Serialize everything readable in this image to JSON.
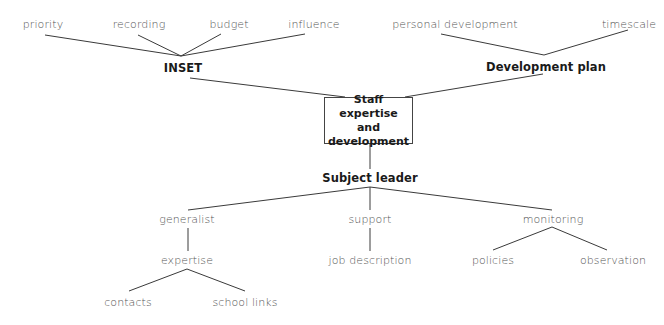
{
  "diagram": {
    "type": "concept-map",
    "center": {
      "label_lines": [
        "Staff expertise",
        "and",
        "development"
      ]
    },
    "top_left": {
      "label": "INSET",
      "children": [
        "priority",
        "recording",
        "budget",
        "influence"
      ]
    },
    "top_right": {
      "label": "Development plan",
      "children": [
        "personal development",
        "timescale"
      ]
    },
    "bottom": {
      "label": "Subject leader",
      "children": [
        {
          "label": "generalist",
          "child": {
            "label": "expertise",
            "children": [
              "contacts",
              "school links"
            ]
          }
        },
        {
          "label": "support",
          "child": {
            "label": "job description"
          }
        },
        {
          "label": "monitoring",
          "children": [
            "policies",
            "observation"
          ]
        }
      ]
    },
    "colors": {
      "line": "#3a3a3a",
      "text": "#555555",
      "bold_text": "#1a1a1a",
      "background": "#ffffff"
    }
  }
}
